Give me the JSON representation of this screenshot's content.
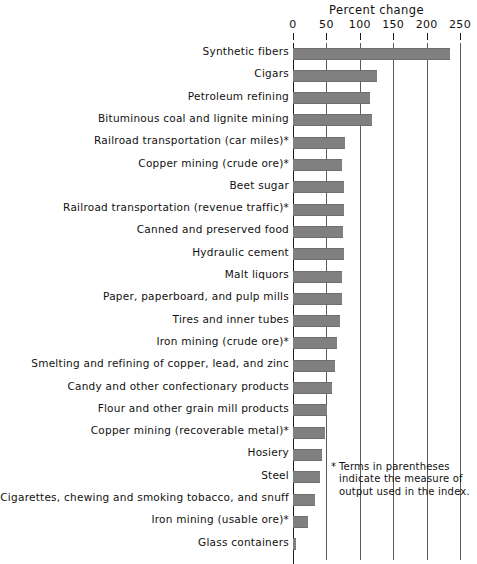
{
  "chart_data": {
    "type": "bar",
    "orientation": "horizontal",
    "title": "Percent change",
    "xlabel": "",
    "ylabel": "",
    "xlim": [
      0,
      250
    ],
    "xticks": [
      0,
      50,
      100,
      150,
      200,
      250
    ],
    "xtick_labels": [
      "0",
      "50",
      "100",
      "150",
      "200",
      "250"
    ],
    "grid": true,
    "legend": null,
    "bar_color": "#808080",
    "categories": [
      "Synthetic fibers",
      "Cigars",
      "Petroleum refining",
      "Bituminous coal and lignite mining",
      "Railroad transportation (car miles)*",
      "Copper mining (crude ore)*",
      "Beet sugar",
      "Railroad transportation (revenue traffic)*",
      "Canned and preserved food",
      "Hydraulic cement",
      "Malt liquors",
      "Paper, paperboard, and pulp mills",
      "Tires and inner tubes",
      "Iron mining (crude ore)*",
      "Smelting and refining of copper, lead, and zinc",
      "Candy and other confectionary products",
      "Flour and other grain mill products",
      "Copper mining (recoverable metal)*",
      "Hosiery",
      "Steel",
      "Cigarettes, chewing and smoking tobacco, and snuff",
      "Iron mining (usable ore)*",
      "Glass containers"
    ],
    "values": [
      235,
      125,
      116,
      119,
      78,
      74,
      77,
      77,
      75,
      76,
      73,
      73,
      70,
      66,
      63,
      58,
      51,
      48,
      44,
      41,
      33,
      23,
      5
    ],
    "annotations": {
      "footnote_marker": "*",
      "footnote_text": "Terms in parentheses indicate the measure of output used in the index."
    }
  }
}
